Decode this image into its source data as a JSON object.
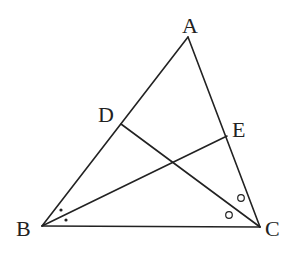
{
  "diagram": {
    "type": "triangle-angle-bisectors",
    "points": {
      "A": {
        "label": "A",
        "x": 188,
        "y": 37
      },
      "B": {
        "label": "B",
        "x": 42,
        "y": 226
      },
      "C": {
        "label": "C",
        "x": 260,
        "y": 227
      },
      "D": {
        "label": "D",
        "x": 121,
        "y": 124
      },
      "E": {
        "label": "E",
        "x": 227,
        "y": 136
      }
    },
    "segments": [
      "AB",
      "BC",
      "CA",
      "BE",
      "CD"
    ],
    "angle_marks": {
      "B": {
        "style": "dot",
        "count": 2,
        "note": "BE bisects angle ABC"
      },
      "C": {
        "style": "circle",
        "count": 2,
        "note": "CD bisects angle ACB"
      }
    }
  }
}
